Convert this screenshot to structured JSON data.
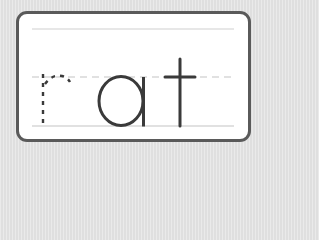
{
  "worksheet": {
    "word": "rat",
    "letters": [
      {
        "char": "r",
        "style": "dashed-trace"
      },
      {
        "char": "a",
        "style": "solid"
      },
      {
        "char": "t",
        "style": "solid"
      }
    ],
    "guidelines": {
      "top": "solid-light",
      "midline": "dashed",
      "baseline": "solid-light"
    }
  },
  "colors": {
    "background": "#e3e3e3",
    "card": "#ffffff",
    "card_border": "#5a5a5a",
    "guideline": "#c8c8c8",
    "letter": "#3a3a3a"
  }
}
